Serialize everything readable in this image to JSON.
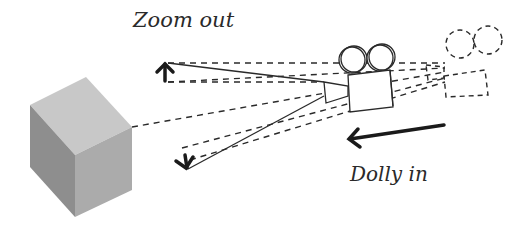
{
  "labels": {
    "zoom_out": "Zoom out",
    "dolly_in": "Dolly in"
  },
  "elements": {
    "subject": "cube-icon",
    "camera_current": "movie-camera-icon",
    "camera_previous": "movie-camera-ghost-icon",
    "zoom_out_arrows": [
      "arrow-up-icon",
      "arrow-down-icon"
    ],
    "dolly_arrow": "arrow-left-icon"
  },
  "colors": {
    "line": "#2a2a2a",
    "cube_top": "#c9c9c9",
    "cube_left": "#8f8f8f",
    "cube_right": "#adadad",
    "background": "#ffffff"
  }
}
